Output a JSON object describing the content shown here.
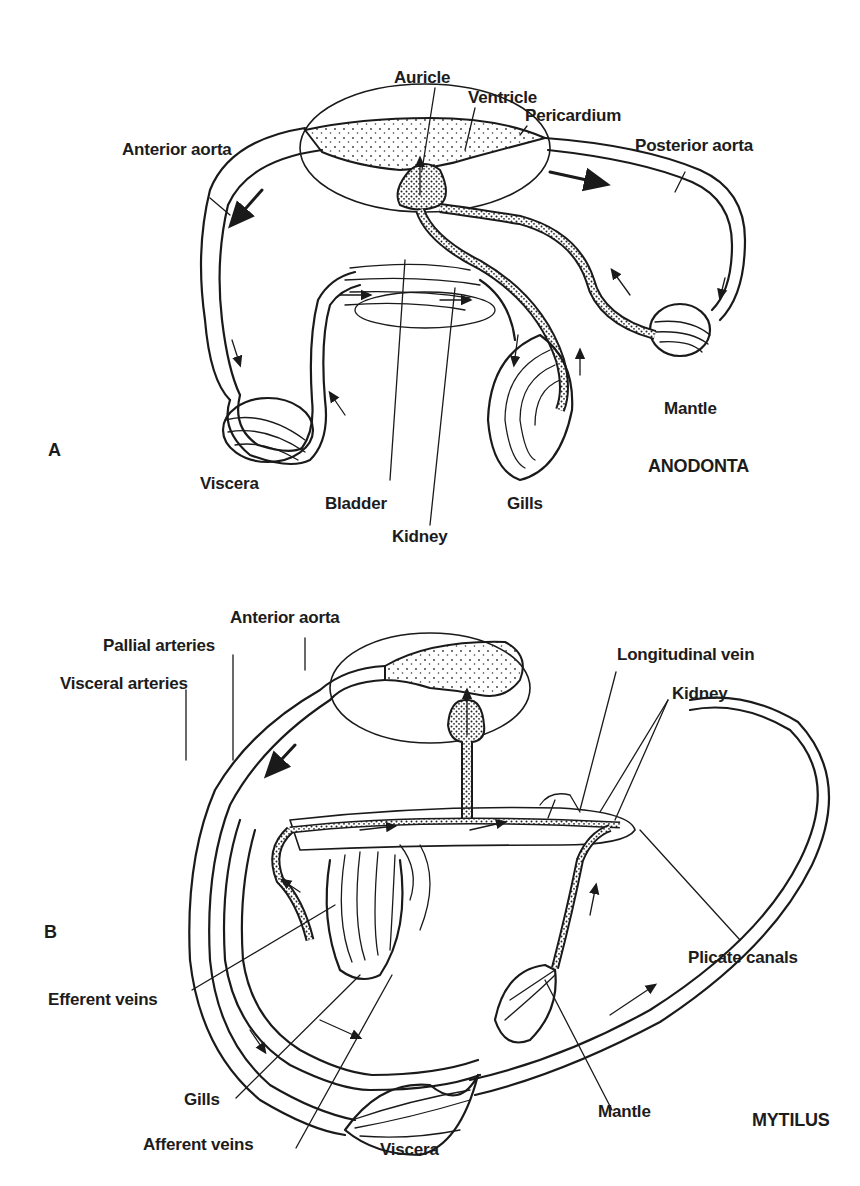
{
  "diagram_a": {
    "panel_letter": "A",
    "organism": "ANODONTA",
    "labels": {
      "auricle": "Auricle",
      "ventricle": "Ventricle",
      "pericardium": "Pericardium",
      "anterior_aorta": "Anterior aorta",
      "posterior_aorta": "Posterior aorta",
      "mantle": "Mantle",
      "viscera": "Viscera",
      "bladder": "Bladder",
      "gills": "Gills",
      "kidney": "Kidney"
    }
  },
  "diagram_b": {
    "panel_letter": "B",
    "organism": "MYTILUS",
    "labels": {
      "anterior_aorta": "Anterior aorta",
      "pallial_arteries": "Pallial arteries",
      "visceral_arteries": "Visceral arteries",
      "longitudinal_vein": "Longitudinal vein",
      "kidney": "Kidney",
      "plicate_canals": "Plicate canals",
      "efferent_veins": "Efferent veins",
      "gills": "Gills",
      "afferent_veins": "Afferent veins",
      "viscera": "Viscera",
      "mantle": "Mantle"
    }
  }
}
